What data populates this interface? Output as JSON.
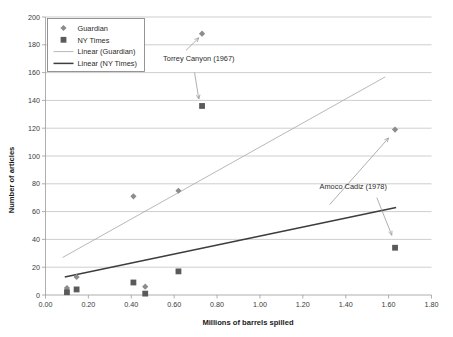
{
  "chart_data": {
    "type": "scatter",
    "title": "",
    "xlabel": "Millions of barrels spilled",
    "ylabel": "Number of articles",
    "xlim": [
      0.0,
      1.8
    ],
    "ylim": [
      0,
      200
    ],
    "xticks": [
      "0.00",
      "0.20",
      "0.40",
      "0.60",
      "0.80",
      "1.00",
      "1.20",
      "1.40",
      "1.60",
      "1.80"
    ],
    "xtick_values": [
      0.0,
      0.2,
      0.4,
      0.6,
      0.8,
      1.0,
      1.2,
      1.4,
      1.6,
      1.8
    ],
    "yticks": [
      "0",
      "20",
      "40",
      "60",
      "80",
      "100",
      "120",
      "140",
      "160",
      "180",
      "200"
    ],
    "ytick_values": [
      0,
      20,
      40,
      60,
      80,
      100,
      120,
      140,
      160,
      180,
      200
    ],
    "grid": "horizontal",
    "legend_position": "top-left",
    "series": [
      {
        "name": "Guardian",
        "marker": "diamond",
        "color": "#8c8c8c",
        "points": [
          {
            "x": 0.1,
            "y": 5
          },
          {
            "x": 0.145,
            "y": 13
          },
          {
            "x": 0.465,
            "y": 6
          },
          {
            "x": 0.41,
            "y": 71
          },
          {
            "x": 0.62,
            "y": 75
          },
          {
            "x": 0.73,
            "y": 188
          },
          {
            "x": 1.63,
            "y": 119
          }
        ]
      },
      {
        "name": "NY Times",
        "marker": "square",
        "color": "#5a5a5a",
        "points": [
          {
            "x": 0.1,
            "y": 2
          },
          {
            "x": 0.145,
            "y": 4
          },
          {
            "x": 0.41,
            "y": 9
          },
          {
            "x": 0.465,
            "y": 1
          },
          {
            "x": 0.62,
            "y": 17
          },
          {
            "x": 0.73,
            "y": 136
          },
          {
            "x": 1.63,
            "y": 34
          }
        ]
      }
    ],
    "trendlines": [
      {
        "name": "Linear (Guardian)",
        "color": "#b0b0b0",
        "x0": 0.08,
        "y0": 27,
        "x1": 1.585,
        "y1": 157
      },
      {
        "name": "Linear (NY Times)",
        "color": "#3d3d3d",
        "x0": 0.09,
        "y0": 13,
        "x1": 1.635,
        "y1": 63
      }
    ],
    "annotations": [
      {
        "label": "Torrey Canyon (1967)",
        "text_x": 0.715,
        "text_y": 168,
        "arrows": [
          {
            "from_x": 0.655,
            "from_y": 176,
            "to_x": 0.715,
            "to_y": 185
          },
          {
            "from_x": 0.695,
            "from_y": 160,
            "to_x": 0.715,
            "to_y": 141
          }
        ]
      },
      {
        "label": "Amoco Cadiz (1978)",
        "text_x": 1.435,
        "text_y": 76,
        "arrows": [
          {
            "from_x": 1.325,
            "from_y": 65,
            "to_x": 1.6,
            "to_y": 113
          },
          {
            "from_x": 1.545,
            "from_y": 70,
            "to_x": 1.615,
            "to_y": 43
          }
        ]
      }
    ]
  },
  "legend": {
    "entries": [
      {
        "label": "Guardian",
        "kind": "diamond"
      },
      {
        "label": "NY Times",
        "kind": "square"
      },
      {
        "label": "Linear (Guardian)",
        "kind": "line-light"
      },
      {
        "label": "Linear (NY Times)",
        "kind": "line-dark"
      }
    ]
  }
}
